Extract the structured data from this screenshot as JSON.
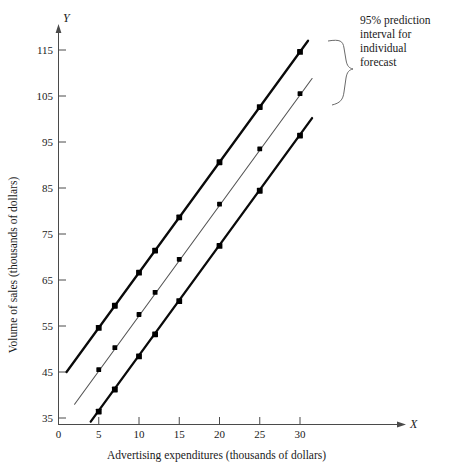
{
  "chart_data": {
    "type": "line",
    "title": "",
    "xlabel": "Advertising expenditures (thousands of dollars)",
    "ylabel": "Volume of sales (thousands of dollars)",
    "x_axis_letter": "X",
    "y_axis_letter": "Y",
    "xlim": [
      0,
      34
    ],
    "ylim": [
      33,
      120
    ],
    "xticks": [
      0,
      5,
      10,
      15,
      20,
      25,
      30
    ],
    "yticks": [
      35,
      45,
      55,
      65,
      75,
      85,
      95,
      105,
      115
    ],
    "xtick_labels": [
      "0",
      "5",
      "10",
      "15",
      "20",
      "25",
      "30"
    ],
    "ytick_labels": [
      "35",
      "45",
      "55",
      "65",
      "75",
      "85",
      "95",
      "105",
      "115"
    ],
    "grid": false,
    "legend": "none",
    "x": [
      5,
      7,
      10,
      12,
      15,
      20,
      25,
      30
    ],
    "series": [
      {
        "name": "upper 95% prediction limit",
        "style": "thick-black",
        "x_start": 1.0,
        "y_start": 45.0,
        "x_end": 31.0,
        "y_end": 117.0,
        "values": [
          54.6,
          59.4,
          66.6,
          71.4,
          78.6,
          90.6,
          102.6,
          114.6
        ]
      },
      {
        "name": "fitted regression line",
        "style": "thin-gray",
        "x_start": 2.0,
        "y_start": 38.0,
        "x_end": 31.5,
        "y_end": 108.8,
        "values": [
          45.5,
          50.3,
          57.5,
          62.3,
          69.5,
          81.5,
          93.5,
          105.5
        ]
      },
      {
        "name": "lower 95% prediction limit",
        "style": "thick-black",
        "x_start": 4.0,
        "y_start": 34.2,
        "x_end": 31.5,
        "y_end": 100.2,
        "values": [
          36.4,
          41.2,
          48.4,
          53.2,
          60.4,
          72.4,
          84.4,
          96.4
        ]
      }
    ],
    "annotations": [
      {
        "id": "prediction-interval-note",
        "lines": [
          "95% prediction",
          "interval for",
          "individual",
          "forecast"
        ],
        "text": "95% prediction interval for individual forecast",
        "brace": "right-curly-bracket"
      }
    ],
    "colors": {
      "band": "#0a0a0a",
      "fit": "#555555",
      "axis": "#4a4a4a",
      "text": "#1a1a1a",
      "background": "#ffffff"
    }
  }
}
